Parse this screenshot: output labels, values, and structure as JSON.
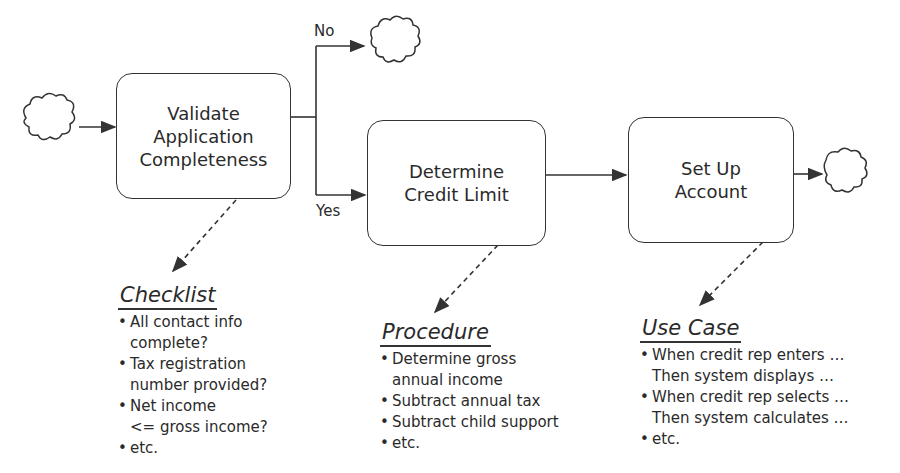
{
  "diagram": {
    "type": "process-flow",
    "steps": [
      {
        "id": "validate",
        "lines": [
          "Validate",
          "Application",
          "Completeness"
        ]
      },
      {
        "id": "credit",
        "lines": [
          "Determine",
          "Credit Limit"
        ]
      },
      {
        "id": "account",
        "lines": [
          "Set Up",
          "Account"
        ]
      }
    ],
    "branch_labels": {
      "no": "No",
      "yes": "Yes"
    },
    "notes": [
      {
        "id": "checklist",
        "title": "Checklist",
        "items": [
          [
            "All contact info",
            "complete?"
          ],
          [
            "Tax registration",
            "number provided?"
          ],
          [
            "Net income",
            "<= gross income?"
          ],
          [
            "etc."
          ]
        ]
      },
      {
        "id": "procedure",
        "title": "Procedure",
        "items": [
          [
            "Determine gross",
            "annual income"
          ],
          [
            "Subtract annual tax"
          ],
          [
            "Subtract child support"
          ],
          [
            "etc."
          ]
        ]
      },
      {
        "id": "usecase",
        "title": "Use Case",
        "items": [
          [
            "When credit rep enters …",
            "Then system displays  …"
          ],
          [
            "When credit rep selects  …",
            "Then system calculates  …"
          ],
          [
            "etc."
          ]
        ]
      }
    ],
    "icons": [
      "start-cloud-icon",
      "rejected-end-cloud-icon",
      "end-cloud-icon"
    ],
    "colors": {
      "line": "#333333",
      "background": "#ffffff"
    }
  }
}
